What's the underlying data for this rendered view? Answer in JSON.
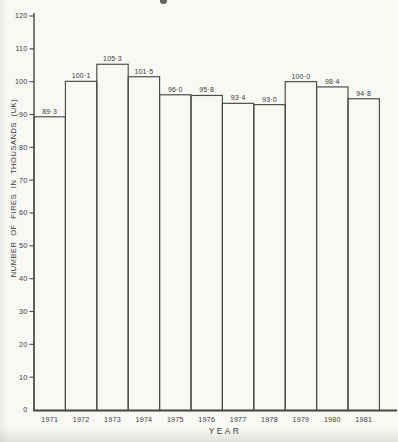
{
  "chart_data": {
    "type": "bar",
    "title": "",
    "xlabel": "YEAR",
    "ylabel": "NUMBER OF FIRES IN THOUSANDS (UK)",
    "categories": [
      "1971",
      "1972",
      "1973",
      "1974",
      "1975",
      "1976",
      "1977",
      "1978",
      "1979",
      "1980",
      "1981"
    ],
    "values": [
      89.3,
      100.1,
      105.3,
      101.5,
      96.0,
      95.8,
      93.4,
      93.0,
      100.0,
      98.4,
      94.8
    ],
    "value_labels": [
      "89·3",
      "100·1",
      "105·3",
      "101·5",
      "96·0",
      "95·8",
      "93·4",
      "93·0",
      "100·0",
      "98·4",
      "94·8"
    ],
    "ylim": [
      0,
      120
    ],
    "yticks": [
      0,
      10,
      20,
      30,
      40,
      50,
      60,
      70,
      80,
      90,
      100,
      110,
      120
    ],
    "ytick_labels": [
      "0",
      "10",
      "20",
      "30",
      "40",
      "50",
      "60",
      "70",
      "80",
      "90",
      "100",
      "110",
      "120"
    ],
    "grid": false,
    "legend": null,
    "bar_style": "adjacent outlined bars, no fill (histogram style)"
  },
  "colors": {
    "ink": "#484844",
    "text": "#3c3c3a",
    "background": "#f8f8f4"
  }
}
